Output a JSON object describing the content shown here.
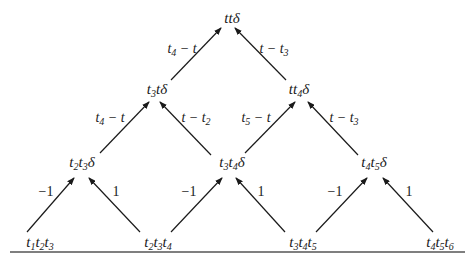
{
  "diagram": {
    "type": "triangular-recursion-tree",
    "nodes": [
      {
        "id": "n_tt",
        "label": "ttδ",
        "parts": [
          [
            "t",
            ""
          ],
          [
            "t",
            ""
          ],
          [
            "δ",
            ""
          ]
        ],
        "x": 232,
        "y": 18
      },
      {
        "id": "n_t3t",
        "label": "t3tδ",
        "parts": [
          [
            "t",
            "3"
          ],
          [
            "t",
            ""
          ],
          [
            "δ",
            ""
          ]
        ],
        "x": 157,
        "y": 90
      },
      {
        "id": "n_tt4",
        "label": "tt4δ",
        "parts": [
          [
            "t",
            ""
          ],
          [
            "t",
            "4"
          ],
          [
            "δ",
            ""
          ]
        ],
        "x": 299,
        "y": 90
      },
      {
        "id": "n_t2t3",
        "label": "t2t3δ",
        "parts": [
          [
            "t",
            "2"
          ],
          [
            "t",
            "3"
          ],
          [
            "δ",
            ""
          ]
        ],
        "x": 82,
        "y": 163
      },
      {
        "id": "n_t3t4",
        "label": "t3t4δ",
        "parts": [
          [
            "t",
            "3"
          ],
          [
            "t",
            "4"
          ],
          [
            "δ",
            ""
          ]
        ],
        "x": 232,
        "y": 163
      },
      {
        "id": "n_t4t5",
        "label": "t4t5δ",
        "parts": [
          [
            "t",
            "4"
          ],
          [
            "t",
            "5"
          ],
          [
            "δ",
            ""
          ]
        ],
        "x": 374,
        "y": 163
      },
      {
        "id": "n_t1t2t3",
        "label": "t1t2t3",
        "parts": [
          [
            "t",
            "1"
          ],
          [
            "t",
            "2"
          ],
          [
            "t",
            "3"
          ]
        ],
        "x": 40,
        "y": 243
      },
      {
        "id": "n_t2t3t4",
        "label": "t2t3t4",
        "parts": [
          [
            "t",
            "2"
          ],
          [
            "t",
            "3"
          ],
          [
            "t",
            "4"
          ]
        ],
        "x": 158,
        "y": 243
      },
      {
        "id": "n_t3t4t5",
        "label": "t3t4t5",
        "parts": [
          [
            "t",
            "3"
          ],
          [
            "t",
            "4"
          ],
          [
            "t",
            "5"
          ]
        ],
        "x": 303,
        "y": 243
      },
      {
        "id": "n_t4t5t6",
        "label": "t4t5t6",
        "parts": [
          [
            "t",
            "4"
          ],
          [
            "t",
            "5"
          ],
          [
            "t",
            "6"
          ]
        ],
        "x": 440,
        "y": 243
      }
    ],
    "edges": [
      {
        "from": "n_t3t",
        "to": "n_tt",
        "label": "t4 − t",
        "parts": [
          [
            "t",
            "4"
          ],
          [
            " − t",
            ""
          ]
        ],
        "x1": 171,
        "y1": 80,
        "x2": 221,
        "y2": 28,
        "lx": 182,
        "ly": 50
      },
      {
        "from": "n_tt4",
        "to": "n_tt",
        "label": "t − t3",
        "parts": [
          [
            "t − t",
            "3"
          ]
        ],
        "x1": 286,
        "y1": 80,
        "x2": 235,
        "y2": 28,
        "lx": 274,
        "ly": 50
      },
      {
        "from": "n_t2t3",
        "to": "n_t3t",
        "label": "t4 − t",
        "parts": [
          [
            "t",
            "4"
          ],
          [
            " − t",
            ""
          ]
        ],
        "x1": 100,
        "y1": 153,
        "x2": 149,
        "y2": 102,
        "lx": 110,
        "ly": 119
      },
      {
        "from": "n_t3t4",
        "to": "n_t3t",
        "label": "t − t2",
        "parts": [
          [
            "t − t",
            "2"
          ]
        ],
        "x1": 211,
        "y1": 155,
        "x2": 160,
        "y2": 102,
        "lx": 196,
        "ly": 119
      },
      {
        "from": "n_t3t4",
        "to": "n_tt4",
        "label": "t5 − t",
        "parts": [
          [
            "t",
            "5"
          ],
          [
            " − t",
            ""
          ]
        ],
        "x1": 245,
        "y1": 153,
        "x2": 295,
        "y2": 102,
        "lx": 256,
        "ly": 119
      },
      {
        "from": "n_t4t5",
        "to": "n_tt4",
        "label": "t − t3",
        "parts": [
          [
            "t − t",
            "3"
          ]
        ],
        "x1": 358,
        "y1": 155,
        "x2": 308,
        "y2": 102,
        "lx": 344,
        "ly": 119
      },
      {
        "from": "n_t1t2t3",
        "to": "n_t2t3",
        "label": "−1",
        "x1": 27,
        "y1": 232,
        "x2": 74,
        "y2": 178,
        "lx": 46,
        "ly": 192
      },
      {
        "from": "n_t2t3t4",
        "to": "n_t2t3",
        "label": "1",
        "x1": 140,
        "y1": 232,
        "x2": 89,
        "y2": 178,
        "lx": 116,
        "ly": 192
      },
      {
        "from": "n_t2t3t4",
        "to": "n_t3t4",
        "label": "−1",
        "x1": 171,
        "y1": 232,
        "x2": 222,
        "y2": 178,
        "lx": 189,
        "ly": 192
      },
      {
        "from": "n_t3t4t5",
        "to": "n_t3t4",
        "label": "1",
        "x1": 285,
        "y1": 232,
        "x2": 236,
        "y2": 178,
        "lx": 261,
        "ly": 192
      },
      {
        "from": "n_t3t4t5",
        "to": "n_t4t5",
        "label": "−1",
        "x1": 316,
        "y1": 232,
        "x2": 367,
        "y2": 178,
        "lx": 335,
        "ly": 192
      },
      {
        "from": "n_t4t5t6",
        "to": "n_t4t5",
        "label": "1",
        "x1": 433,
        "y1": 232,
        "x2": 383,
        "y2": 178,
        "lx": 409,
        "ly": 192
      }
    ],
    "baseline": {
      "x1": 10,
      "y1": 252,
      "x2": 465,
      "y2": 252
    },
    "colors": {
      "line": "#1a1a1a",
      "text": "#1a1a1a",
      "background": "#ffffff"
    }
  }
}
